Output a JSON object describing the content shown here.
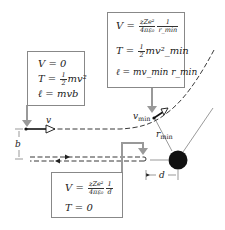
{
  "colors": {
    "box_border": "#888888",
    "connector": "#999999",
    "trajectory": "#222222",
    "nucleus": "#111111"
  },
  "box_initial": {
    "v_eq": "V = 0",
    "t_lhs": "T = ",
    "t_frac_num": "1",
    "t_frac_den": "2",
    "t_rhs": "mv²",
    "l_eq": "ℓ = mvb"
  },
  "box_closest": {
    "v_lhs": "V = ",
    "v_frac1_num": "zZe²",
    "v_frac1_den": "4πε₀",
    "v_frac2_num": "1",
    "v_frac2_den": "r_min",
    "t_lhs": "T = ",
    "t_frac_num": "1",
    "t_frac_den": "2",
    "t_rhs": "mv²_min",
    "l_eq": "ℓ = mv_min r_min"
  },
  "box_headon": {
    "v_lhs": "V = ",
    "v_frac1_num": "zZe²",
    "v_frac1_den": "4πε₀",
    "v_frac2_num": "1",
    "v_frac2_den": "d",
    "t_eq": "T = 0"
  },
  "labels": {
    "v": "v",
    "v_min": "v",
    "v_min_sub": "min",
    "r_min": "r",
    "r_min_sub": "min",
    "b": "b",
    "d": "d"
  }
}
